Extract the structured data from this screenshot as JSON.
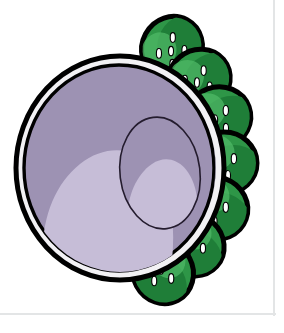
{
  "figure": {
    "background_color": "#ffffff",
    "frame": {
      "rule_color": "#e3e5e6",
      "right_rule_x": 273,
      "bottom_rule_y": 313
    },
    "vesicle": {
      "name": "purple-vesicle",
      "outline_color": "#000000",
      "rim_band_color": "#f2f1f4",
      "body_fill": "#9d92b3",
      "highlight_fill": "#c6bdd7",
      "inner_opening_outline": "#241c2e",
      "center_x": 120,
      "center_y": 168,
      "radius_x": 104,
      "radius_y": 112
    },
    "discs": {
      "name": "green-disc-cluster",
      "count": 7,
      "outline_color": "#000000",
      "fill_color": "#2e9647",
      "fill_dark": "#1f7e38",
      "highlight_color": "#4fb865",
      "pore_color": "#ffffff",
      "pore_outline": "#000000",
      "pores_per_disc": 5,
      "items": [
        {
          "label": "disc-1",
          "cx": 172,
          "cy": 48,
          "rx": 32,
          "ry": 30,
          "rot": -62
        },
        {
          "label": "disc-2",
          "cx": 199,
          "cy": 80,
          "rx": 32,
          "ry": 30,
          "rot": -40
        },
        {
          "label": "disc-3",
          "cx": 218,
          "cy": 118,
          "rx": 33,
          "ry": 31,
          "rot": -20
        },
        {
          "label": "disc-4",
          "cx": 224,
          "cy": 163,
          "rx": 33,
          "ry": 31,
          "rot": 0
        },
        {
          "label": "disc-5",
          "cx": 215,
          "cy": 208,
          "rx": 33,
          "ry": 31,
          "rot": 20
        },
        {
          "label": "disc-6",
          "cx": 193,
          "cy": 245,
          "rx": 32,
          "ry": 30,
          "rot": 42
        },
        {
          "label": "disc-7",
          "cx": 163,
          "cy": 272,
          "rx": 32,
          "ry": 30,
          "rot": 62
        }
      ]
    },
    "chart_data": {
      "type": "diagram",
      "title": "Cell organelle cross-section illustration",
      "elements": [
        {
          "name": "purple-vesicle",
          "count": 1,
          "color": "#9d92b3",
          "description": "large cut-open purple sphere with double-line rim and pale interior highlight"
        },
        {
          "name": "green-disc",
          "count": 7,
          "color": "#2e9647",
          "description": "green oval discs with black outline and five white pores each, arranged in an arc behind the vesicle"
        }
      ]
    }
  }
}
